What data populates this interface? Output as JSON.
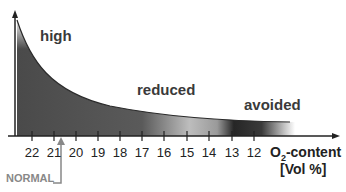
{
  "zones": {
    "high": "high",
    "reduced": "reduced",
    "avoided": "avoided"
  },
  "x_axis": {
    "ticks": [
      "22",
      "21",
      "20",
      "19",
      "18",
      "17",
      "16",
      "15",
      "14",
      "13",
      "12"
    ],
    "title_line1_prefix": "O",
    "title_subscript": "2",
    "title_line1_suffix": "-content",
    "title_line2": "[Vol %]"
  },
  "marker": {
    "label": "NORMAL",
    "value": "21"
  },
  "colors": {
    "curve_fill_dark": "#505050",
    "curve_fill_light": "#c8c8c8",
    "avoided_band": "#222222",
    "text": "#3a3a3a",
    "marker": "#888888"
  }
}
